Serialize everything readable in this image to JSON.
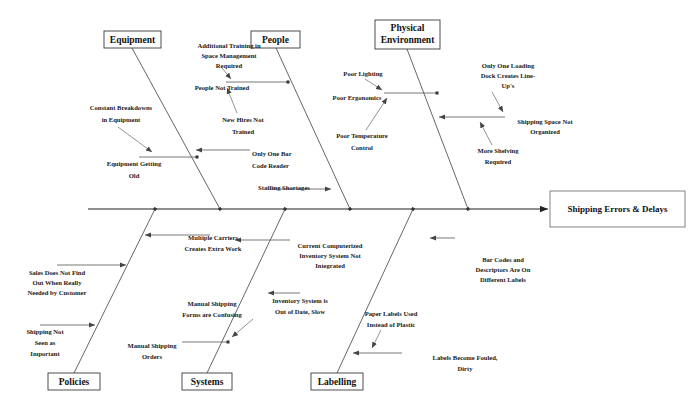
{
  "diagram": {
    "type": "fishbone-ishikawa-cause-and-effect",
    "effect": "Shipping Errors & Delays",
    "colors": {
      "background": "#ffffff",
      "spine": "#222222",
      "bone": "#555555",
      "box_border": "#3a3a3a",
      "text": "#1a1a1a"
    },
    "categories": [
      {
        "id": "equipment",
        "label": "Equipment",
        "position": "top",
        "causes": [
          "Constant Breakdowns in Equipment",
          "Equipment Getting Old",
          "Only One Bar Code Reader"
        ]
      },
      {
        "id": "people",
        "label": "People",
        "position": "top",
        "causes": [
          "Additional Training in Space Management Required",
          "People Not Trained",
          "New Hires Not Trained",
          "Staffing Shortages"
        ]
      },
      {
        "id": "physical-environment",
        "label": "Physical Environment",
        "position": "top",
        "causes": [
          "Poor Lighting",
          "Poor Ergonomics",
          "Poor Temperature Control",
          "Only One Loading Dock Creates Line-Up's",
          "Shipping Space Not Organized",
          "More Shelving Required"
        ]
      },
      {
        "id": "policies",
        "label": "Policies",
        "position": "bottom",
        "causes": [
          "Sales Does Not Find Out When Really Needed by Customer",
          "Shipping Not Seen as Important",
          "Multiple Carriers Creates Extra Work"
        ]
      },
      {
        "id": "systems",
        "label": "Systems",
        "position": "bottom",
        "causes": [
          "Current Computerized Inventory System Not Integrated",
          "Inventory System is Out of Date, Slow",
          "Manual Shipping Forms are Confusing",
          "Manual Shipping Orders"
        ]
      },
      {
        "id": "labelling",
        "label": "Labelling",
        "position": "bottom",
        "causes": [
          "Bar Codes and Descriptors Are On Different Labels",
          "Paper Labels Used Instead of Plastic",
          "Labels Become Fouled, Dirty"
        ]
      }
    ]
  },
  "boxes": {
    "equipment": {
      "label": "Equipment"
    },
    "people": {
      "label": "People"
    },
    "physical_environment_line1": {
      "label": "Physical"
    },
    "physical_environment_line2": {
      "label": "Environment"
    },
    "policies": {
      "label": "Policies"
    },
    "systems": {
      "label": "Systems"
    },
    "labelling": {
      "label": "Labelling"
    },
    "effect": {
      "label": "Shipping Errors & Delays"
    }
  },
  "labels": {
    "additional_training_l1": "Additional Training in",
    "additional_training_l2": "Space Management",
    "additional_training_l3": "Required",
    "people_not_trained": "People Not Trained",
    "new_hires_l1": "New Hires Not",
    "new_hires_l2": "Trained",
    "constant_breakdowns_l1": "Constant Breakdowns",
    "constant_breakdowns_l2": "in Equipment",
    "equipment_old_l1": "Equipment Getting",
    "equipment_old_l2": "Old",
    "bar_code_reader_l1": "Only One Bar",
    "bar_code_reader_l2": "Code Reader",
    "staffing_shortages": "Staffing Shortages",
    "poor_lighting": "Poor Lighting",
    "poor_ergonomics": "Poor Ergonomics",
    "poor_temperature_l1": "Poor Temperature",
    "poor_temperature_l2": "Control",
    "loading_dock_l1": "Only One Loading",
    "loading_dock_l2": "Dock Creates Line-",
    "loading_dock_l3": "Up's",
    "shipping_space_l1": "Shipping Space Not",
    "shipping_space_l2": "Organized",
    "more_shelving_l1": "More Shelving",
    "more_shelving_l2": "Required",
    "sales_not_find_l1": "Sales Does Not Find",
    "sales_not_find_l2": "Out When Really",
    "sales_not_find_l3": "Needed by Customer",
    "shipping_not_seen_l1": "Shipping Not",
    "shipping_not_seen_l2": "Seen as",
    "shipping_not_seen_l3": "Important",
    "multiple_carriers_l1": "Multiple Carriers",
    "multiple_carriers_l2": "Creates Extra Work",
    "manual_forms_l1": "Manual Shipping",
    "manual_forms_l2": "Forms are Confusing",
    "manual_orders_l1": "Manual Shipping",
    "manual_orders_l2": "Orders",
    "current_inventory_l1": "Current Computerized",
    "current_inventory_l2": "Inventory System Not",
    "current_inventory_l3": "Integrated",
    "inventory_old_l1": "Inventory System is",
    "inventory_old_l2": "Out of Date, Slow",
    "bar_codes_desc_l1": "Bar Codes and",
    "bar_codes_desc_l2": "Descriptors Are On",
    "bar_codes_desc_l3": "Different Labels",
    "paper_labels_l1": "Paper Labels Used",
    "paper_labels_l2": "Instead of Plastic",
    "labels_fouled_l1": "Labels Become Fouled,",
    "labels_fouled_l2": "Dirty"
  }
}
